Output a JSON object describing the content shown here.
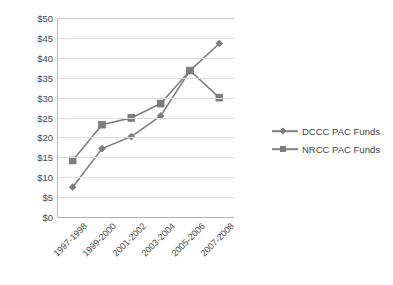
{
  "chart_data": {
    "type": "line",
    "title": "",
    "xlabel": "",
    "ylabel": "Millions of $",
    "categories": [
      "1997-1998",
      "1999-2000",
      "2001-2002",
      "2003-2004",
      "2005-2006",
      "2007-2008"
    ],
    "series": [
      {
        "name": "DCCC PAC Funds",
        "marker": "diamond",
        "color": "#808080",
        "values": [
          7.5,
          17.2,
          20.2,
          25.4,
          36.8,
          43.6
        ]
      },
      {
        "name": "NRCC PAC Funds",
        "marker": "square",
        "color": "#808080",
        "values": [
          14.2,
          23.2,
          24.9,
          28.5,
          36.8,
          30.0
        ]
      }
    ],
    "ylim": [
      0,
      50
    ],
    "ytick_step": 5,
    "ytick_labels": [
      "$0",
      "$5",
      "$10",
      "$15",
      "$20",
      "$25",
      "$30",
      "$35",
      "$40",
      "$45",
      "$50"
    ],
    "grid": true,
    "grid_axis": "y",
    "legend_position": "right",
    "legend_entries": [
      "DCCC PAC Funds",
      "NRCC PAC Funds"
    ]
  },
  "colors": {
    "series_gray": "#808080",
    "gridline": "#dcdcdc",
    "axis": "#b8b8b8",
    "text": "#3f3f3f",
    "background": "#ffffff"
  }
}
